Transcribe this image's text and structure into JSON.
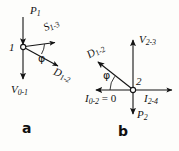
{
  "figure": {
    "type": "vector-phasor-diagram",
    "background_color": "#fdfdfb",
    "ink_color": "#141414",
    "panels": [
      {
        "id": "a",
        "letter": "a",
        "node_label": "1",
        "angle_label": "φ",
        "vectors": [
          {
            "name": "P1",
            "base": "P",
            "sub": "1",
            "direction": "down-into-node",
            "label_x": 30,
            "label_y": 6
          },
          {
            "name": "S1-3",
            "base": "S",
            "sub": "1-3",
            "direction": "right",
            "label_x": 47,
            "label_y": 28
          },
          {
            "name": "D1-2",
            "base": "D",
            "sub": "1-2",
            "direction": "down-right",
            "label_x": 56,
            "label_y": 70
          },
          {
            "name": "V0-1",
            "base": "V",
            "sub": "0-1",
            "direction": "down",
            "label_x": 12,
            "label_y": 86
          }
        ]
      },
      {
        "id": "b",
        "letter": "b",
        "node_label": "2",
        "angle_label": "φ",
        "vectors": [
          {
            "name": "V2-3",
            "base": "V",
            "sub": "2-3",
            "direction": "up",
            "label_x": 140,
            "label_y": 36
          },
          {
            "name": "D1-2",
            "base": "D",
            "sub": "1-2",
            "direction": "up-left",
            "label_x": 92,
            "label_y": 44
          },
          {
            "name": "I2-4",
            "base": "I",
            "sub": "2-4",
            "direction": "right",
            "label_x": 145,
            "label_y": 95
          },
          {
            "name": "I0-2",
            "base": "I",
            "sub": "0-2",
            "direction": "left",
            "suffix": " = 0",
            "label_x": 86,
            "label_y": 95
          },
          {
            "name": "P2",
            "base": "P",
            "sub": "2",
            "direction": "down",
            "label_x": 137,
            "label_y": 110
          }
        ]
      }
    ]
  }
}
